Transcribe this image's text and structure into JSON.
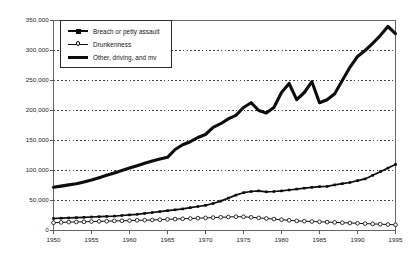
{
  "chart_data": {
    "type": "line",
    "title": "",
    "subtitle": "",
    "xlabel": "",
    "ylabel": "",
    "xlim": [
      1950,
      1995
    ],
    "ylim": [
      0,
      350000
    ],
    "grid": true,
    "grid_orientation": "horizontal",
    "legend_position": "top-left inside plot",
    "ytick_labels": [
      "0",
      "50,000",
      "100,000",
      "150,000",
      "200,000",
      "250,000",
      "300,000",
      "350,000"
    ],
    "ytick_values": [
      0,
      50000,
      100000,
      150000,
      200000,
      250000,
      300000,
      350000
    ],
    "xtick_labels": [
      "1950",
      "1955",
      "1960",
      "1965",
      "1970",
      "1975",
      "1980",
      "1985",
      "1990",
      "1995"
    ],
    "xtick_values": [
      1950,
      1955,
      1960,
      1965,
      1970,
      1975,
      1980,
      1985,
      1990,
      1995
    ],
    "x": [
      1950,
      1951,
      1952,
      1953,
      1954,
      1955,
      1956,
      1957,
      1958,
      1959,
      1960,
      1961,
      1962,
      1963,
      1964,
      1965,
      1966,
      1967,
      1968,
      1969,
      1970,
      1971,
      1972,
      1973,
      1974,
      1975,
      1976,
      1977,
      1978,
      1979,
      1980,
      1981,
      1982,
      1983,
      1984,
      1985,
      1986,
      1987,
      1988,
      1989,
      1990,
      1991,
      1992,
      1993,
      1994,
      1995
    ],
    "series": [
      {
        "name": "Breach or petty assault",
        "marker": "square",
        "line_width": 1.7,
        "color": "#0d0d0d",
        "values": [
          20000,
          20500,
          21000,
          21500,
          22000,
          22500,
          23000,
          23500,
          24000,
          25000,
          26000,
          27000,
          28500,
          30000,
          31500,
          33000,
          34500,
          36000,
          38000,
          40000,
          42000,
          45000,
          49000,
          54000,
          59000,
          63000,
          65000,
          66000,
          64500,
          65000,
          66000,
          67500,
          69000,
          70500,
          72000,
          73000,
          73500,
          76000,
          78000,
          80000,
          83000,
          86000,
          92000,
          98000,
          104000,
          110000
        ]
      },
      {
        "name": "Drunkenness",
        "marker": "circle-open",
        "line_width": 1.0,
        "color": "#0d0d0d",
        "values": [
          13000,
          13500,
          14000,
          14200,
          14500,
          15000,
          15200,
          15500,
          16000,
          16200,
          16500,
          17000,
          17200,
          17500,
          18000,
          18500,
          19000,
          19500,
          20000,
          20500,
          21000,
          21500,
          22000,
          22500,
          23000,
          22800,
          22000,
          21000,
          20000,
          19000,
          18000,
          17000,
          16000,
          15500,
          15000,
          14500,
          14000,
          13500,
          13000,
          12500,
          12000,
          11500,
          11000,
          10500,
          10000,
          9500
        ]
      },
      {
        "name": "Other, driving, and mv",
        "marker": "none",
        "line_width": 3.1,
        "color": "#0d0d0d",
        "values": [
          72000,
          74000,
          76000,
          78000,
          81000,
          84000,
          88000,
          92000,
          96000,
          100000,
          104000,
          108000,
          112000,
          116000,
          119000,
          122000,
          135000,
          143000,
          148000,
          155000,
          160000,
          172000,
          178000,
          186000,
          192000,
          205000,
          213000,
          200000,
          196000,
          205000,
          230000,
          245000,
          218000,
          230000,
          248000,
          213000,
          218000,
          228000,
          250000,
          272000,
          290000,
          300000,
          312000,
          325000,
          340000,
          328000
        ]
      }
    ]
  },
  "legend": {
    "items": [
      {
        "label": "Breach or petty assault",
        "swatch": "thick-line-square-marker"
      },
      {
        "label": "Drunkenness",
        "swatch": "thin-line-open-circle-marker"
      },
      {
        "label": "Other, driving, and mv",
        "swatch": "very-thick-line"
      }
    ]
  },
  "axes": {
    "frame_color": "#555555",
    "gridline_color": "#2b2b2b",
    "gridline_style": "dotted"
  }
}
